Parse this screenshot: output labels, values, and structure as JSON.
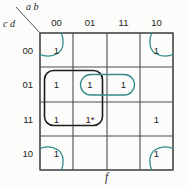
{
  "kmap": {
    "type": "karnaugh-map",
    "output_label": "f",
    "col_vars": "a b",
    "row_vars": "c d",
    "col_headers": [
      "00",
      "01",
      "11",
      "10"
    ],
    "row_headers": [
      "00",
      "01",
      "11",
      "10"
    ],
    "cells": {
      "r0c0": "1",
      "r0c1": "",
      "r0c2": "",
      "r0c3": "1",
      "r1c0": "1",
      "r1c1": "1",
      "r1c2": "1",
      "r1c3": "",
      "r2c0": "1",
      "r2c1": "1*",
      "r2c2": "",
      "r2c3": "1",
      "r3c0": "1",
      "r3c1": "",
      "r3c2": "",
      "r3c3": "1"
    },
    "groups": [
      {
        "name": "corner-wraparound-loop",
        "color": "teal",
        "cells": [
          "ab=00,cd=00",
          "ab=10,cd=00",
          "ab=00,cd=10",
          "ab=10,cd=10"
        ]
      },
      {
        "name": "black-2x2-group",
        "color": "black",
        "cells": [
          "ab=00,cd=01",
          "ab=01,cd=01",
          "ab=00,cd=11",
          "ab=01,cd=11"
        ]
      },
      {
        "name": "teal-oval-group",
        "color": "teal",
        "cells": [
          "ab=01,cd=01",
          "ab=11,cd=01"
        ]
      }
    ],
    "colors": {
      "teal": "#338b8b",
      "black": "#1d1d1d",
      "grid": "#4d4d4d"
    }
  }
}
